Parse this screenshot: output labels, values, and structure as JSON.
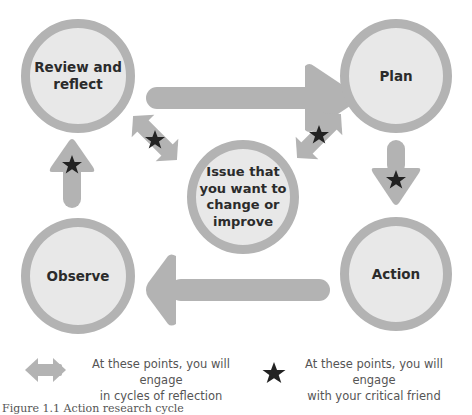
{
  "diagram": {
    "title": "Action research cycle",
    "colors": {
      "circle_fill": "#e8e8e8",
      "circle_border": "#b3b3b3",
      "arrow": "#b3b3b3",
      "star": "#222222",
      "text": "#2b2b2b"
    },
    "nodes": {
      "review": "Review and reflect",
      "review_line1": "Review and",
      "review_line2": "reflect",
      "plan": "Plan",
      "action": "Action",
      "observe": "Observe",
      "center": "Issue that you want to change or improve",
      "center_line1": "Issue that",
      "center_line2": "you want to",
      "center_line3": "change or",
      "center_line4": "improve"
    },
    "arrows": [
      {
        "from": "Review and reflect",
        "to": "Plan",
        "star": false
      },
      {
        "from": "Plan",
        "to": "Action",
        "star": true
      },
      {
        "from": "Action",
        "to": "Observe",
        "star": false
      },
      {
        "from": "Observe",
        "to": "Review and reflect",
        "star": true
      },
      {
        "from": "Issue",
        "to": "Review and reflect",
        "type": "double",
        "star": true
      },
      {
        "from": "Issue",
        "to": "Plan",
        "type": "double",
        "star": true
      }
    ]
  },
  "legend": {
    "double_arrow_line1": "At these points, you will engage",
    "double_arrow_line2": "in cycles of reflection",
    "star_line1": "At these points, you will engage",
    "star_line2": "with your critical friend"
  },
  "caption": "Figure 1.1 Action research cycle"
}
